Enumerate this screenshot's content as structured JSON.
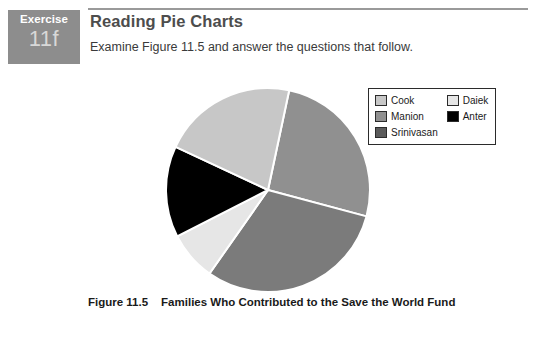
{
  "badge": {
    "word": "Exercise",
    "number": "11f"
  },
  "header": {
    "title": "Reading Pie Charts",
    "subtitle": "Examine Figure 11.5 and answer the questions that follow."
  },
  "caption": {
    "figure_number": "Figure 11.5",
    "figure_title": "Families Who Contributed to the Save the World Fund"
  },
  "footer": {
    "ghost_text": ""
  },
  "legend": {
    "columns": [
      {
        "items": [
          {
            "label": "Cook",
            "color": "#c7c7c7"
          },
          {
            "label": "Manion",
            "color": "#909090"
          },
          {
            "label": "Srinivasan",
            "color": "#5a5a5a"
          }
        ]
      },
      {
        "items": [
          {
            "label": "Daiek",
            "color": "#e6e6e6"
          },
          {
            "label": "Anter",
            "color": "#000000"
          }
        ]
      }
    ]
  },
  "chart_data": {
    "type": "pie",
    "title": "Families Who Contributed to the Save the World Fund",
    "labels": [
      "Cook",
      "Manion",
      "Srinivasan",
      "Daiek",
      "Anter"
    ],
    "values": [
      26,
      26,
      30,
      8,
      14
    ],
    "unit": "percent",
    "colors": [
      "#c7c7c7",
      "#909090",
      "#7b7b7b",
      "#e6e6e6",
      "#000000"
    ],
    "legend_position": "top-right",
    "grid": false,
    "start_angle_deg": 12,
    "direction": "clockwise",
    "slice_gap_color": "#ffffff",
    "slices": [
      {
        "label": "Manion",
        "color": "#909090",
        "start_deg": 12,
        "end_deg": 105,
        "percent": 26
      },
      {
        "label": "Srinivasan",
        "color": "#7b7b7b",
        "start_deg": 105,
        "end_deg": 215,
        "percent": 30
      },
      {
        "label": "Daiek",
        "color": "#e6e6e6",
        "start_deg": 215,
        "end_deg": 243,
        "percent": 8
      },
      {
        "label": "Anter",
        "color": "#000000",
        "start_deg": 243,
        "end_deg": 295,
        "percent": 14
      },
      {
        "label": "Cook",
        "color": "#c7c7c7",
        "start_deg": 295,
        "end_deg": 372,
        "percent": 21
      }
    ]
  }
}
